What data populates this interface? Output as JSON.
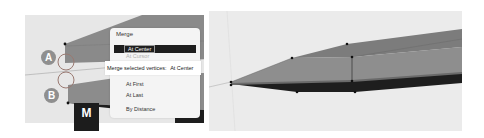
{
  "left_panel": {
    "labels": {
      "a": "A",
      "b": "B"
    },
    "key_hint": "M",
    "menu": {
      "title": "Merge",
      "items": [
        {
          "label": "At Center",
          "active": true
        },
        {
          "label": "At Cursor",
          "active": false,
          "obscured": true
        },
        {
          "label": "At First",
          "active": false
        },
        {
          "label": "At Last",
          "active": false
        },
        {
          "label": "By Distance",
          "active": false
        }
      ]
    },
    "tooltip": {
      "label": "Merge selected vertices:",
      "value": "At Center"
    }
  },
  "right_panel": {
    "description": "merged mesh result"
  },
  "colors": {
    "viewport_bg": "#e7e7e7",
    "mesh_face": "#8a8a8a",
    "mesh_dark": "#1e1e1e",
    "menu_bg": "#f4f4f4",
    "menu_highlight": "#1e1e1e",
    "badge": "#8f8f8f"
  }
}
